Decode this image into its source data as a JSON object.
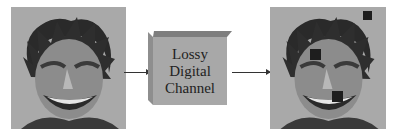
{
  "diagram": {
    "input_image": {
      "label": "original-face-image"
    },
    "channel": {
      "lines": [
        "Lossy",
        "Digital",
        "Channel"
      ]
    },
    "output_image": {
      "label": "corrupted-face-image",
      "lost_blocks": 3
    },
    "colors": {
      "box_front": "#a8a8a8",
      "box_top": "#7e7e7e",
      "arrow": "#333333",
      "image_bg": "#a9a9a9"
    }
  }
}
